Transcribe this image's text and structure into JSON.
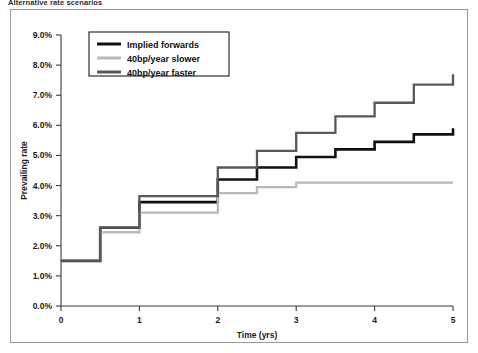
{
  "figure": {
    "title": "Alternative rate scenarios"
  },
  "chart_data": {
    "type": "line",
    "title": "Alternative rate scenarios",
    "xlabel": "Time (yrs)",
    "ylabel": "Prevailing rate",
    "xlim": [
      0,
      5
    ],
    "ylim": [
      0,
      9
    ],
    "grid": false,
    "legend_position": "top-left-inside",
    "step_style": "post",
    "x_ticks": [
      "0",
      "1",
      "2",
      "3",
      "4",
      "5"
    ],
    "x_tick_values": [
      0,
      1,
      2,
      3,
      4,
      5
    ],
    "y_ticks": [
      "0.0%",
      "1.0%",
      "2.0%",
      "3.0%",
      "4.0%",
      "5.0%",
      "6.0%",
      "7.0%",
      "8.0%",
      "9.0%"
    ],
    "y_tick_values": [
      0,
      1,
      2,
      3,
      4,
      5,
      6,
      7,
      8,
      9
    ],
    "series": [
      {
        "name": "Implied forwards",
        "color": "#111111",
        "width": 2.6,
        "x": [
          0,
          0.5,
          1.0,
          1.5,
          2.0,
          2.5,
          3.0,
          3.5,
          4.0,
          4.5,
          5.0
        ],
        "values": [
          1.5,
          2.6,
          3.45,
          3.45,
          4.2,
          4.6,
          4.95,
          5.2,
          5.45,
          5.7,
          5.9
        ]
      },
      {
        "name": "40bp/year slower",
        "color": "#b9b9b9",
        "width": 2.3,
        "x": [
          0,
          0.5,
          1.0,
          1.5,
          2.0,
          2.5,
          3.0,
          3.5,
          4.0,
          4.5,
          5.0
        ],
        "values": [
          1.5,
          2.45,
          3.1,
          3.1,
          3.75,
          3.95,
          4.1,
          4.1,
          4.1,
          4.1,
          4.1
        ]
      },
      {
        "name": "40bp/year faster",
        "color": "#585858",
        "width": 2.3,
        "x": [
          0,
          0.5,
          1.0,
          1.5,
          2.0,
          2.5,
          3.0,
          3.5,
          4.0,
          4.5,
          5.0
        ],
        "values": [
          1.5,
          2.6,
          3.65,
          3.65,
          4.6,
          5.15,
          5.75,
          6.3,
          6.75,
          7.35,
          7.7
        ]
      }
    ]
  },
  "legend": {
    "entries": [
      {
        "label": "Implied forwards",
        "color": "#111111"
      },
      {
        "label": "40bp/year slower",
        "color": "#b9b9b9"
      },
      {
        "label": "40bp/year faster",
        "color": "#585858"
      }
    ]
  }
}
